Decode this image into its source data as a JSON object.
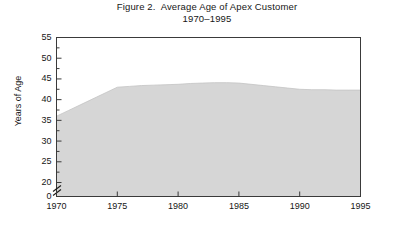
{
  "figure": {
    "title": "Figure 2.  Average Age of Apex Customer",
    "subtitle": "1970–1995"
  },
  "axes": {
    "ylabel": "Years of Age",
    "xlabel": "",
    "y_ticks": [
      "55",
      "50",
      "45",
      "40",
      "35",
      "30",
      "25",
      "20",
      "0"
    ],
    "x_ticks": [
      "1970",
      "1975",
      "1980",
      "1985",
      "1990",
      "1995"
    ],
    "axis_break": "//",
    "frame_color": "#3a3a3a",
    "area_fill": "#d6d6d6",
    "area_edge": "#c4c4c4",
    "background": "#ffffff"
  },
  "chart_data": {
    "type": "area",
    "title": "Figure 2.  Average Age of Apex Customer",
    "subtitle": "1970–1995",
    "xlabel": "",
    "ylabel": "Years of Age",
    "xlim": [
      1970,
      1995
    ],
    "ylim": [
      20,
      55
    ],
    "y_axis_break_below": 20,
    "y_ticks": [
      20,
      25,
      30,
      35,
      40,
      45,
      50,
      55
    ],
    "x_ticks": [
      1970,
      1975,
      1980,
      1985,
      1990,
      1995
    ],
    "minor_y_ticks": true,
    "grid": false,
    "legend": null,
    "x": [
      1970,
      1971,
      1972,
      1973,
      1974,
      1975,
      1976,
      1977,
      1978,
      1979,
      1980,
      1981,
      1982,
      1983,
      1984,
      1985,
      1986,
      1987,
      1988,
      1989,
      1990,
      1991,
      1992,
      1993,
      1994,
      1995
    ],
    "values": [
      36.0,
      37.4,
      38.8,
      40.2,
      41.6,
      43.0,
      43.2,
      43.4,
      43.5,
      43.6,
      43.7,
      43.9,
      44.0,
      44.1,
      44.1,
      44.0,
      43.7,
      43.4,
      43.1,
      42.8,
      42.5,
      42.4,
      42.4,
      42.3,
      42.3,
      42.3
    ],
    "series": [
      {
        "name": "Average age of Apex customer",
        "values": [
          36.0,
          37.4,
          38.8,
          40.2,
          41.6,
          43.0,
          43.2,
          43.4,
          43.5,
          43.6,
          43.7,
          43.9,
          44.0,
          44.1,
          44.1,
          44.0,
          43.7,
          43.4,
          43.1,
          42.8,
          42.5,
          42.4,
          42.4,
          42.3,
          42.3,
          42.3
        ]
      }
    ]
  }
}
